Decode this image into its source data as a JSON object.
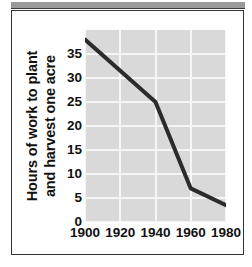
{
  "figure": {
    "background_color": "#ffffff",
    "border_color": "#333333",
    "top_band_color": "#9a9a9a"
  },
  "chart_data": {
    "type": "line",
    "title": "",
    "subtitle": "",
    "xlabel": "",
    "ylabel_lines": [
      "Hours of work to plant",
      "and harvest one acre"
    ],
    "ylabel": "Hours of work to plant and harvest one acre",
    "x": [
      1900,
      1920,
      1940,
      1960,
      1980
    ],
    "categories": [
      "1900",
      "1920",
      "1940",
      "1960",
      "1980"
    ],
    "values": [
      38,
      31.5,
      25,
      7,
      3.5
    ],
    "series": [
      {
        "name": "Hours of work to plant and harvest one acre",
        "values": [
          38,
          31.5,
          25,
          7,
          3.5
        ],
        "color": "#2b2b2b"
      }
    ],
    "xlim": [
      1900,
      1980
    ],
    "ylim": [
      0,
      40
    ],
    "xticks": [
      1900,
      1920,
      1940,
      1960,
      1980
    ],
    "xticklabels": [
      "1900",
      "1920",
      "1940",
      "1960",
      "1980"
    ],
    "yticks": [
      0,
      5,
      10,
      15,
      20,
      25,
      30,
      35
    ],
    "yticklabels": [
      "0",
      "5",
      "10",
      "15",
      "20",
      "25",
      "30",
      "35"
    ],
    "grid": true,
    "grid_color": "#f6f6f6",
    "plot_background": "#d9d9d9",
    "legend": false,
    "legend_position": "none",
    "line_color": "#2b2b2b",
    "line_width": 4,
    "markers": false,
    "annotations": []
  }
}
